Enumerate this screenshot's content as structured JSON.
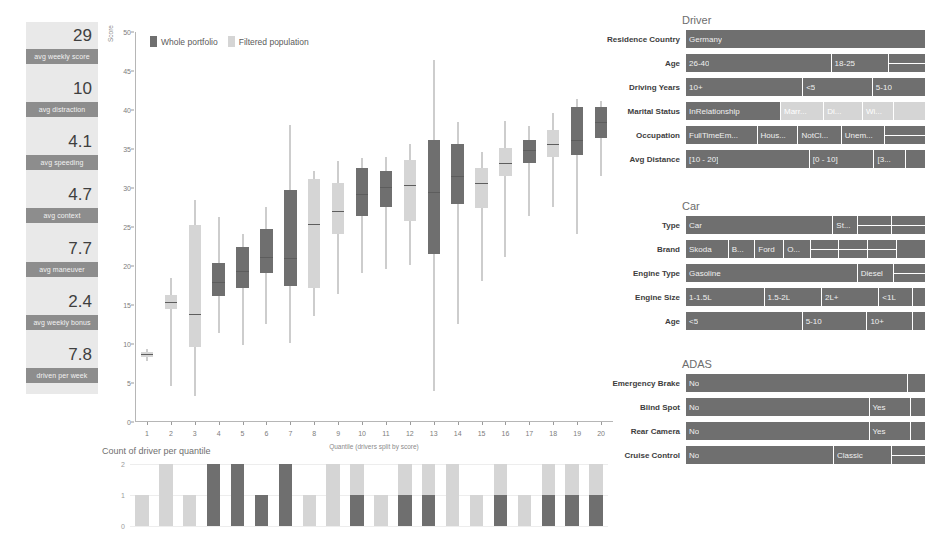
{
  "colors": {
    "dark": "#6f6f6f",
    "light": "#d5d5d5",
    "mid": "#a8a8a8",
    "panel_bg": "#e9e9e9",
    "label_bg": "#8d8d8d",
    "text": "#4a4a4a"
  },
  "kpi": {
    "items": [
      {
        "value": "29",
        "label": "avg weekly score"
      },
      {
        "value": "10",
        "label": "avg distraction"
      },
      {
        "value": "4.1",
        "label": "avg speeding"
      },
      {
        "value": "4.7",
        "label": "avg context"
      },
      {
        "value": "7.7",
        "label": "avg maneuver"
      },
      {
        "value": "2.4",
        "label": "avg weekly bonus"
      },
      {
        "value": "7.8",
        "label": "driven per week"
      }
    ]
  },
  "chart_data": [
    {
      "type": "boxplot",
      "title": "",
      "xlabel": "Quantile (drivers split by score)",
      "ylabel": "Score",
      "ylim": [
        0,
        50
      ],
      "yticks": [
        0,
        5,
        10,
        15,
        20,
        25,
        30,
        35,
        40,
        45,
        50
      ],
      "grid": false,
      "legend_position": "top-left",
      "legend": [
        "Whole portfolio",
        "Filtered population"
      ],
      "categories": [
        "1",
        "2",
        "3",
        "4",
        "5",
        "6",
        "7",
        "8",
        "9",
        "10",
        "11",
        "12",
        "13",
        "14",
        "15",
        "16",
        "17",
        "18",
        "19",
        "20"
      ],
      "series_colors": {
        "Whole portfolio": "#6f6f6f",
        "Filtered population": "#d5d5d5"
      },
      "boxes": [
        {
          "q": "1",
          "group": "Filtered population",
          "min": 7.8,
          "q1": 8.3,
          "median": 8.7,
          "q3": 9.0,
          "max": 9.4
        },
        {
          "q": "2",
          "group": "Filtered population",
          "min": 4.6,
          "q1": 14.5,
          "median": 15.4,
          "q3": 16.3,
          "max": 18.4
        },
        {
          "q": "3",
          "group": "Filtered population",
          "min": 3.3,
          "q1": 9.6,
          "median": 13.9,
          "q3": 25.2,
          "max": 28.4
        },
        {
          "q": "4",
          "group": "Whole portfolio",
          "min": 11.4,
          "q1": 16.1,
          "median": 17.9,
          "q3": 20.4,
          "max": 26.3
        },
        {
          "q": "5",
          "group": "Whole portfolio",
          "min": 9.9,
          "q1": 17.2,
          "median": 19.4,
          "q3": 22.4,
          "max": 24.1
        },
        {
          "q": "6",
          "group": "Whole portfolio",
          "min": 12.6,
          "q1": 19.1,
          "median": 21.2,
          "q3": 24.7,
          "max": 27.6
        },
        {
          "q": "7",
          "group": "Whole portfolio",
          "min": 10.1,
          "q1": 17.4,
          "median": 21.0,
          "q3": 29.7,
          "max": 38.1
        },
        {
          "q": "8",
          "group": "Filtered population",
          "min": 13.6,
          "q1": 17.2,
          "median": 25.4,
          "q3": 31.1,
          "max": 32.2
        },
        {
          "q": "9",
          "group": "Filtered population",
          "min": 16.4,
          "q1": 24.1,
          "median": 27.1,
          "q3": 30.6,
          "max": 33.4
        },
        {
          "q": "10",
          "group": "Whole portfolio",
          "min": 19.1,
          "q1": 26.4,
          "median": 29.2,
          "q3": 32.6,
          "max": 33.9
        },
        {
          "q": "11",
          "group": "Whole portfolio",
          "min": 19.6,
          "q1": 27.5,
          "median": 30.1,
          "q3": 32.2,
          "max": 34.0
        },
        {
          "q": "12",
          "group": "Filtered population",
          "min": 20.1,
          "q1": 25.8,
          "median": 30.4,
          "q3": 33.6,
          "max": 35.6
        },
        {
          "q": "13",
          "group": "Whole portfolio",
          "min": 4.0,
          "q1": 21.5,
          "median": 29.5,
          "q3": 36.1,
          "max": 46.4
        },
        {
          "q": "14",
          "group": "Whole portfolio",
          "min": 12.6,
          "q1": 28.0,
          "median": 31.6,
          "q3": 35.6,
          "max": 38.4
        },
        {
          "q": "15",
          "group": "Filtered population",
          "min": 18.1,
          "q1": 27.4,
          "median": 30.6,
          "q3": 32.6,
          "max": 34.6
        },
        {
          "q": "16",
          "group": "Filtered population",
          "min": 21.2,
          "q1": 31.6,
          "median": 33.2,
          "q3": 35.1,
          "max": 38.6
        },
        {
          "q": "17",
          "group": "Whole portfolio",
          "min": 26.4,
          "q1": 33.2,
          "median": 34.9,
          "q3": 36.2,
          "max": 38.0
        },
        {
          "q": "18",
          "group": "Filtered population",
          "min": 27.6,
          "q1": 34.0,
          "median": 35.7,
          "q3": 37.4,
          "max": 39.6
        },
        {
          "q": "19",
          "group": "Whole portfolio",
          "min": 24.1,
          "q1": 34.2,
          "median": 36.2,
          "q3": 40.4,
          "max": 41.4
        },
        {
          "q": "20",
          "group": "Whole portfolio",
          "min": 31.6,
          "q1": 36.4,
          "median": 38.4,
          "q3": 40.4,
          "max": 41.2
        }
      ]
    },
    {
      "type": "bar",
      "title": "Count of driver per quantile",
      "xlabel": "",
      "ylabel": "",
      "ylim": [
        0,
        2
      ],
      "yticks": [
        0,
        1,
        2
      ],
      "grid": true,
      "categories": [
        "1",
        "2",
        "3",
        "4",
        "5",
        "6",
        "7",
        "8",
        "9",
        "10",
        "11",
        "12",
        "13",
        "14",
        "15",
        "16",
        "17",
        "18",
        "19",
        "20"
      ],
      "series": [
        {
          "name": "Whole portfolio",
          "values": [
            0,
            0,
            0,
            2,
            2,
            1,
            2,
            0,
            0,
            1,
            0,
            1,
            1,
            0,
            0,
            1,
            0,
            1,
            1,
            1
          ]
        },
        {
          "name": "Filtered population",
          "values": [
            1,
            2,
            1,
            0,
            0,
            0,
            0,
            1,
            2,
            1,
            1,
            1,
            1,
            2,
            1,
            1,
            1,
            1,
            1,
            1
          ]
        }
      ],
      "totals": [
        1,
        2,
        1,
        2,
        2,
        1,
        2,
        1,
        2,
        2,
        1,
        2,
        2,
        2,
        1,
        2,
        1,
        2,
        2,
        2
      ]
    }
  ],
  "panels": [
    {
      "id": "driver",
      "title": "Driver",
      "rows": [
        {
          "label": "Residence Country",
          "segments": [
            {
              "text": "Germany",
              "w": 100,
              "tone": "dark"
            }
          ]
        },
        {
          "label": "Age",
          "segments": [
            {
              "text": "26-40",
              "w": 61,
              "tone": "dark"
            },
            {
              "text": "18-25",
              "w": 24,
              "tone": "dark"
            },
            {
              "text": "",
              "w": 15,
              "tone": "dark",
              "split": 2
            }
          ]
        },
        {
          "label": "Driving Years",
          "segments": [
            {
              "text": "10+",
              "w": 49,
              "tone": "dark"
            },
            {
              "text": "<5",
              "w": 29,
              "tone": "dark"
            },
            {
              "text": "5-10",
              "w": 22,
              "tone": "dark"
            }
          ]
        },
        {
          "label": "Marital Status",
          "segments": [
            {
              "text": "InRelationship",
              "w": 40,
              "tone": "dark"
            },
            {
              "text": "Marr...",
              "w": 18,
              "tone": "light"
            },
            {
              "text": "Di...",
              "w": 16,
              "tone": "light"
            },
            {
              "text": "Wi...",
              "w": 13,
              "tone": "light"
            },
            {
              "text": "",
              "w": 13,
              "tone": "light"
            }
          ]
        },
        {
          "label": "Occupation",
          "segments": [
            {
              "text": "FullTimeEm...",
              "w": 30,
              "tone": "dark"
            },
            {
              "text": "Hous...",
              "w": 17,
              "tone": "dark"
            },
            {
              "text": "NotCl...",
              "w": 18,
              "tone": "dark"
            },
            {
              "text": "Unem...",
              "w": 18,
              "tone": "dark"
            },
            {
              "text": "",
              "w": 17,
              "tone": "dark",
              "split": 2
            }
          ]
        },
        {
          "label": "Avg Distance",
          "segments": [
            {
              "text": "[10 - 20]",
              "w": 52,
              "tone": "dark"
            },
            {
              "text": "[0 - 10]",
              "w": 27,
              "tone": "dark"
            },
            {
              "text": "[3...",
              "w": 13,
              "tone": "dark"
            },
            {
              "text": "",
              "w": 8,
              "tone": "dark"
            }
          ]
        }
      ]
    },
    {
      "id": "car",
      "title": "Car",
      "rows": [
        {
          "label": "Type",
          "segments": [
            {
              "text": "Car",
              "w": 62,
              "tone": "dark"
            },
            {
              "text": "St...",
              "w": 10,
              "tone": "dark"
            },
            {
              "text": "",
              "w": 14,
              "tone": "dark",
              "split": 2
            },
            {
              "text": "",
              "w": 14,
              "tone": "dark",
              "split": 2
            }
          ]
        },
        {
          "label": "Brand",
          "segments": [
            {
              "text": "Skoda",
              "w": 18,
              "tone": "dark"
            },
            {
              "text": "B...",
              "w": 11,
              "tone": "dark"
            },
            {
              "text": "Ford",
              "w": 12,
              "tone": "dark"
            },
            {
              "text": "O...",
              "w": 11,
              "tone": "dark"
            },
            {
              "text": "",
              "w": 12,
              "tone": "dark",
              "split": 2
            },
            {
              "text": "",
              "w": 12,
              "tone": "dark",
              "split": 2
            },
            {
              "text": "",
              "w": 12,
              "tone": "dark",
              "split": 2
            },
            {
              "text": "",
              "w": 12,
              "tone": "dark"
            }
          ]
        },
        {
          "label": "Engine Type",
          "segments": [
            {
              "text": "Gasoline",
              "w": 72,
              "tone": "dark"
            },
            {
              "text": "Diesel",
              "w": 15,
              "tone": "dark"
            },
            {
              "text": "",
              "w": 13,
              "tone": "dark",
              "split": 2
            }
          ]
        },
        {
          "label": "Engine Size",
          "segments": [
            {
              "text": "1-1.5L",
              "w": 33,
              "tone": "dark"
            },
            {
              "text": "1.5-2L",
              "w": 24,
              "tone": "dark"
            },
            {
              "text": "2L+",
              "w": 24,
              "tone": "dark"
            },
            {
              "text": "<1L",
              "w": 14,
              "tone": "dark"
            },
            {
              "text": "",
              "w": 5,
              "tone": "dark"
            }
          ]
        },
        {
          "label": "Age",
          "segments": [
            {
              "text": "<5",
              "w": 49,
              "tone": "dark"
            },
            {
              "text": "5-10",
              "w": 27,
              "tone": "dark"
            },
            {
              "text": "10+",
              "w": 19,
              "tone": "dark"
            },
            {
              "text": "",
              "w": 5,
              "tone": "dark"
            }
          ]
        }
      ]
    },
    {
      "id": "adas",
      "title": "ADAS",
      "rows": [
        {
          "label": "Emergency Brake",
          "segments": [
            {
              "text": "No",
              "w": 93,
              "tone": "dark"
            },
            {
              "text": "",
              "w": 7,
              "tone": "dark"
            }
          ]
        },
        {
          "label": "Blind Spot",
          "segments": [
            {
              "text": "No",
              "w": 77,
              "tone": "dark"
            },
            {
              "text": "Yes",
              "w": 17,
              "tone": "dark"
            },
            {
              "text": "",
              "w": 6,
              "tone": "dark"
            }
          ]
        },
        {
          "label": "Rear Camera",
          "segments": [
            {
              "text": "No",
              "w": 77,
              "tone": "dark"
            },
            {
              "text": "Yes",
              "w": 17,
              "tone": "dark"
            },
            {
              "text": "",
              "w": 6,
              "tone": "dark"
            }
          ]
        },
        {
          "label": "Cruise Control",
          "segments": [
            {
              "text": "No",
              "w": 62,
              "tone": "dark"
            },
            {
              "text": "Classic",
              "w": 24,
              "tone": "dark"
            },
            {
              "text": "",
              "w": 14,
              "tone": "dark",
              "split": 2
            }
          ]
        }
      ]
    }
  ]
}
